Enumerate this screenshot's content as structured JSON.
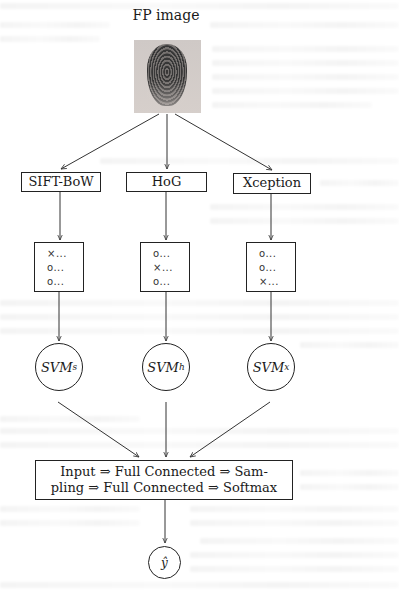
{
  "diagram": {
    "title": "FP image",
    "input_image": {
      "description": "fingerprint image",
      "icon": "fingerprint-image"
    },
    "feature_extractors": [
      {
        "id": "sift",
        "label": "SIFT-BoW"
      },
      {
        "id": "hog",
        "label": "HoG"
      },
      {
        "id": "xception",
        "label": "Xception"
      }
    ],
    "vote_vectors": [
      {
        "id": "sift",
        "rows": [
          "×...",
          "o...",
          "o..."
        ]
      },
      {
        "id": "hog",
        "rows": [
          "o...",
          "×...",
          "o..."
        ]
      },
      {
        "id": "xception",
        "rows": [
          "o...",
          "o...",
          "×..."
        ]
      }
    ],
    "classifiers": [
      {
        "id": "svm_s",
        "base": "SVM",
        "subscript": "s"
      },
      {
        "id": "svm_h",
        "base": "SVM",
        "subscript": "h"
      },
      {
        "id": "svm_x",
        "base": "SVM",
        "subscript": "x"
      }
    ],
    "fusion": {
      "line1": "Input ⇒ Full Connected ⇒ Sam-",
      "line2": "pling ⇒ Full Connected ⇒ Softmax"
    },
    "output": {
      "label": "ŷ"
    },
    "edges": [
      {
        "from": "FP image",
        "to": "SIFT-BoW"
      },
      {
        "from": "FP image",
        "to": "HoG"
      },
      {
        "from": "FP image",
        "to": "Xception"
      },
      {
        "from": "SIFT-BoW",
        "to": "vote-sift"
      },
      {
        "from": "HoG",
        "to": "vote-hog"
      },
      {
        "from": "Xception",
        "to": "vote-xception"
      },
      {
        "from": "vote-sift",
        "to": "SVM_s"
      },
      {
        "from": "vote-hog",
        "to": "SVM_h"
      },
      {
        "from": "vote-xception",
        "to": "SVM_x"
      },
      {
        "from": "SVM_s",
        "to": "fusion"
      },
      {
        "from": "SVM_h",
        "to": "fusion"
      },
      {
        "from": "SVM_x",
        "to": "fusion"
      },
      {
        "from": "fusion",
        "to": "ŷ"
      }
    ]
  }
}
